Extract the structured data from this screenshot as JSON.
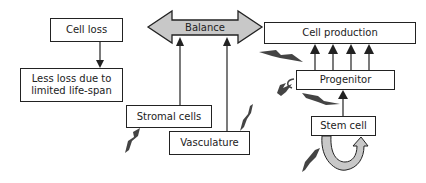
{
  "diagram": {
    "nodes": {
      "cell_loss": "Cell loss",
      "less_loss": "Less loss due to limited life-span",
      "balance": "Balance",
      "cell_production": "Cell production",
      "progenitor": "Progenitor",
      "stromal_cells": "Stromal cells",
      "vasculature": "Vasculature",
      "stem_cell": "Stem cell"
    },
    "edges": [
      {
        "from": "cell_loss",
        "to": "less_loss"
      },
      {
        "from": "stromal_cells",
        "to": "balance"
      },
      {
        "from": "vasculature",
        "to": "balance"
      },
      {
        "from": "progenitor",
        "to": "cell_production",
        "count": 4
      },
      {
        "from": "stem_cell",
        "to": "progenitor"
      },
      {
        "from": "stem_cell",
        "to": "stem_cell",
        "type": "self-renewal"
      }
    ],
    "balance_arrow": {
      "direction": "bidirectional",
      "fill": "#c8c8c8",
      "connects": [
        "cell_loss",
        "cell_production"
      ]
    },
    "colors": {
      "line": "#222222",
      "box_fill": "#ffffff",
      "arrow_fill": "#c8c8c8",
      "bolt_fill": "#444444"
    }
  }
}
